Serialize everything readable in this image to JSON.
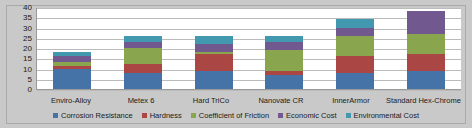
{
  "chart_data": {
    "type": "bar",
    "stacked": true,
    "title": "",
    "xlabel": "",
    "ylabel": "",
    "ylim": [
      0,
      40
    ],
    "ytick_step": 5,
    "yticks": [
      40,
      35,
      30,
      25,
      20,
      15,
      10,
      5,
      0
    ],
    "grid": true,
    "legend_position": "bottom",
    "categories": [
      "Enviro-Alloy",
      "Metex 6",
      "Hard TriCo",
      "Nanovate CR",
      "InnerArmor",
      "Standard Hex-Chrome"
    ],
    "series": [
      {
        "name": "Corrosion Resistance",
        "color": "#4573a7",
        "values": [
          10,
          8,
          9,
          7,
          8,
          9
        ]
      },
      {
        "name": "Hardness",
        "color": "#aa4644",
        "values": [
          1,
          4,
          8,
          2,
          8,
          8
        ]
      },
      {
        "name": "Coefficient of Friction",
        "color": "#89a54e",
        "values": [
          2,
          8,
          1,
          10,
          10,
          10
        ]
      },
      {
        "name": "Economic Cost",
        "color": "#71588f",
        "values": [
          3,
          3,
          4,
          4,
          4,
          11
        ]
      },
      {
        "name": "Environmental Cost",
        "color": "#4198af",
        "values": [
          2,
          3,
          4,
          3,
          4,
          0
        ]
      }
    ],
    "totals": [
      18,
      26,
      26,
      26,
      34,
      38
    ]
  },
  "colors": {
    "background": "#c9c9c9",
    "plot_background": "#ffffff",
    "gridline": "#bcbcbc",
    "axis": "#9a9a9a",
    "text": "#1a1a1a"
  }
}
